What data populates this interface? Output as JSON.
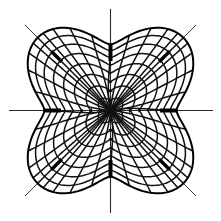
{
  "figure": {
    "title": "Conformal coordinate grid",
    "background_color": "#ffffff",
    "ink_color": "#111111",
    "axis_color": "#2b2b2b",
    "diagonal_color": "#3a3a3a",
    "width": 221,
    "height": 221
  },
  "chart_data": {
    "type": "line",
    "title": "Conformal coordinate grid",
    "subtitle": "",
    "xlabel": "",
    "ylabel": "",
    "xlim": [
      0,
      221
    ],
    "ylim": [
      0,
      221
    ],
    "grid": true,
    "legend": "none",
    "center": {
      "x": 110.5,
      "y": 110.5
    },
    "symmetry_order": 4,
    "radial_ray_count": 8,
    "radial_ray_angles_deg": [
      0,
      45,
      90,
      135,
      180,
      225,
      270,
      315
    ],
    "annotations": [
      {
        "name": "center-node",
        "x": 110.5,
        "y": 110.5,
        "kind": "convergence"
      },
      {
        "name": "singular-right",
        "x": 173,
        "y": 110.5,
        "kind": "branch-point"
      },
      {
        "name": "singular-left",
        "x": 48,
        "y": 110.5,
        "kind": "branch-point"
      },
      {
        "name": "singular-top",
        "x": 110.5,
        "y": 48,
        "kind": "branch-point"
      },
      {
        "name": "singular-bottom",
        "x": 110.5,
        "y": 173,
        "kind": "branch-point"
      },
      {
        "name": "singular-upper-left",
        "x": 54,
        "y": 54,
        "kind": "cusp"
      },
      {
        "name": "singular-upper-right",
        "x": 167,
        "y": 54,
        "kind": "cusp"
      },
      {
        "name": "singular-lower-left",
        "x": 54,
        "y": 167,
        "kind": "cusp"
      },
      {
        "name": "singular-lower-right",
        "x": 167,
        "y": 167,
        "kind": "cusp"
      }
    ],
    "axes_overlay": [
      {
        "name": "horizontal-axis",
        "x1": 9,
        "y1": 110.5,
        "x2": 213,
        "y2": 110.5
      },
      {
        "name": "vertical-axis",
        "x1": 110.5,
        "y1": 9,
        "x2": 110.5,
        "y2": 213
      },
      {
        "name": "diagonal-axis-nw-se",
        "x1": 25,
        "y1": 25,
        "x2": 196,
        "y2": 196
      },
      {
        "name": "diagonal-axis-ne-sw",
        "x1": 196,
        "y1": 25,
        "x2": 25,
        "y2": 196
      }
    ],
    "series": [
      {
        "name": "radial-family",
        "count": 40,
        "description": "curves emanating from center toward outer boundary"
      },
      {
        "name": "transverse-family",
        "count": 8,
        "description": "nested closed scalloped loops orthogonal to radial family"
      },
      {
        "name": "outer-boundary",
        "count": 1,
        "description": "four-lobed scalloped outer contour"
      }
    ],
    "radii_levels": [
      0.0,
      0.16,
      0.31,
      0.45,
      0.58,
      0.7,
      0.81,
      0.91,
      1.0
    ],
    "lobe_inner_radius_px": 66,
    "lobe_outer_radius_px": 103
  }
}
